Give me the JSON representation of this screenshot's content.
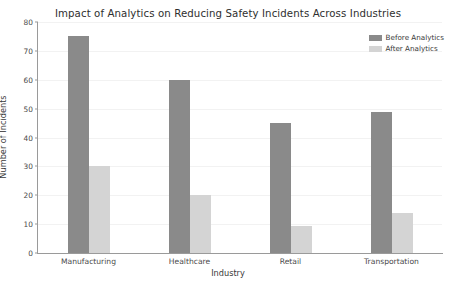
{
  "chart_data": {
    "type": "bar",
    "title": "Impact of Analytics on Reducing Safety Incidents Across Industries",
    "xlabel": "Industry",
    "ylabel": "Number of Incidents",
    "categories": [
      "Manufacturing",
      "Healthcare",
      "Retail",
      "Transportation"
    ],
    "series": [
      {
        "name": "Before Analytics",
        "color": "#8a8a8a",
        "values": [
          75,
          60,
          45,
          49
        ]
      },
      {
        "name": "After Analytics",
        "color": "#d4d4d4",
        "values": [
          30,
          20,
          9.5,
          14
        ]
      }
    ],
    "ylim": [
      0,
      80
    ],
    "yticks": [
      0,
      10,
      20,
      30,
      40,
      50,
      60,
      70,
      80
    ],
    "ytick_labels": [
      "0",
      "10",
      "20",
      "30",
      "40",
      "50",
      "60",
      "70",
      "80"
    ],
    "grid": true,
    "legend_position": "upper right"
  },
  "colors": {
    "background": "#ffffff",
    "axis": "#9a9a9a",
    "grid": "#f2f2f2",
    "text": "#3a3a3a",
    "before_analytics": "#8a8a8a",
    "after_analytics": "#d4d4d4"
  }
}
